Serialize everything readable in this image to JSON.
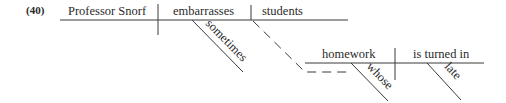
{
  "example_number": "(40)",
  "main_clause": {
    "subject": "Professor Snorf",
    "verb": "embarrasses",
    "object": "students",
    "verb_modifier": "sometimes"
  },
  "relative_clause": {
    "subject": "homework",
    "verb": "is turned in",
    "subject_modifier": "whose",
    "verb_modifier": "late"
  },
  "colors": {
    "ink": "#2a2a2a",
    "background": "#ffffff"
  }
}
